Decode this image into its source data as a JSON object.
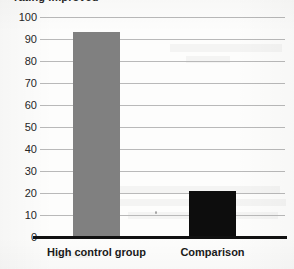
{
  "chart_data": {
    "type": "bar",
    "title": "rating improved",
    "xlabel": "",
    "ylabel": "",
    "categories": [
      "High control group",
      "Comparison"
    ],
    "values": [
      93,
      21
    ],
    "series": [
      {
        "name": "percent rating improved",
        "values": [
          93,
          21
        ],
        "colors": [
          "#808080",
          "#0d0d0d"
        ]
      }
    ],
    "ylim": [
      0,
      100
    ],
    "ytick_labels": [
      "0",
      "10",
      "20",
      "30",
      "40",
      "50",
      "60",
      "70",
      "80",
      "90",
      "100"
    ],
    "ytick_values": [
      0,
      10,
      20,
      30,
      40,
      50,
      60,
      70,
      80,
      90,
      100
    ],
    "grid": true,
    "legend": false,
    "legend_position": "none",
    "annotations": []
  },
  "colors": {
    "bar_gray": "#808080",
    "bar_black": "#0d0d0d",
    "gridline": "#b9b9b9",
    "axis": "#111111",
    "text": "#1a1a1a",
    "background": "#fdfdfc"
  }
}
